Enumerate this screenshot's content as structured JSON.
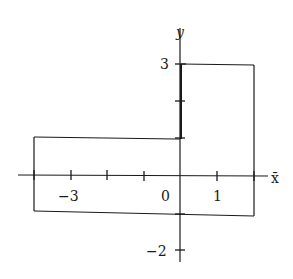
{
  "diagram": {
    "type": "coordinate-plot-region",
    "axes": {
      "x_label": "x̄",
      "y_label": "y",
      "x_tick_labels": [
        {
          "value": -3,
          "text": "−3"
        },
        {
          "value": 0,
          "text": "0"
        },
        {
          "value": 1,
          "text": "1"
        }
      ],
      "y_tick_labels": [
        {
          "value": 3,
          "text": "3"
        },
        {
          "value": -2,
          "text": "−2"
        }
      ],
      "x_ticks": [
        -4,
        -3,
        -2,
        -1,
        0,
        1,
        2
      ],
      "y_ticks": [
        3,
        2,
        1,
        0,
        -1,
        -2
      ]
    },
    "region": {
      "description": "L-shaped region: left rectangle from x=-4 to 0, y=-1 to 1; right rectangle from x=0 to 2, y=-1 to 3",
      "vertices": [
        [
          -4,
          -1
        ],
        [
          2,
          -1
        ],
        [
          2,
          3
        ],
        [
          0,
          3
        ],
        [
          0,
          1
        ],
        [
          -4,
          1
        ]
      ]
    },
    "colors": {
      "line": "#1a1a1a",
      "background": "#ffffff"
    }
  }
}
